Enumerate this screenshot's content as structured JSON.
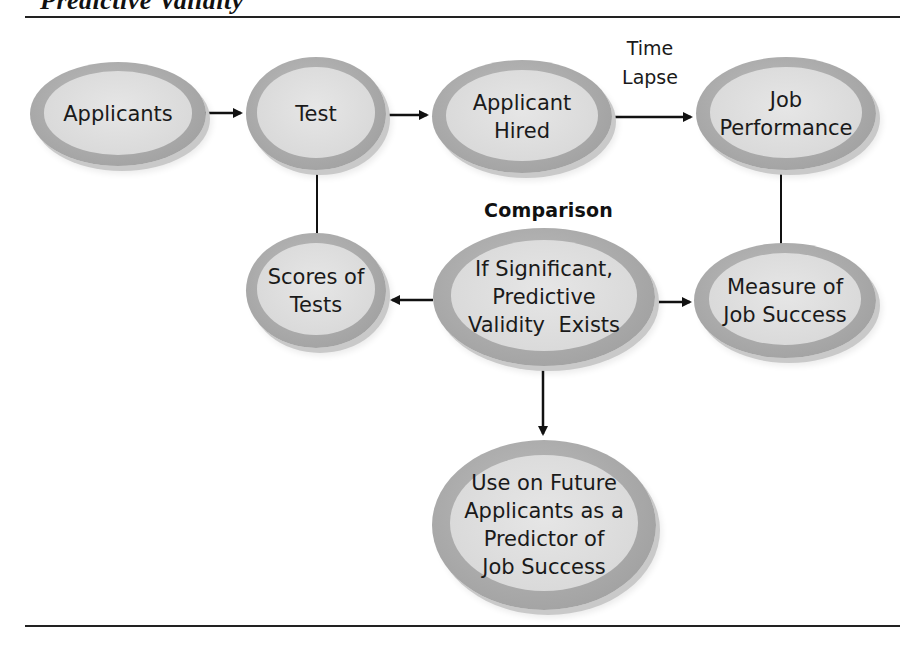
{
  "figure": {
    "title": "Predictive Validity"
  },
  "nodes": {
    "applicants": {
      "lines": [
        "Applicants"
      ]
    },
    "test": {
      "lines": [
        "Test"
      ]
    },
    "applicant_hired": {
      "lines": [
        "Applicant",
        "Hired"
      ]
    },
    "job_performance": {
      "lines": [
        "Job",
        "Performance"
      ]
    },
    "scores_of_tests": {
      "lines": [
        "Scores of",
        "Tests"
      ]
    },
    "comparison_result": {
      "lines": [
        "If Significant,",
        "Predictive",
        "Validity  Exists"
      ]
    },
    "measure_of_job_success": {
      "lines": [
        "Measure of",
        "Job Success"
      ]
    },
    "future_use": {
      "lines": [
        "Use on Future",
        "Applicants as a",
        "Predictor of",
        "Job Success"
      ]
    }
  },
  "labels": {
    "time_lapse": [
      "Time",
      "Lapse"
    ],
    "comparison": "Comparison"
  },
  "edges": [
    {
      "from": "Applicants",
      "to": "Test",
      "type": "arrow"
    },
    {
      "from": "Test",
      "to": "Applicant Hired",
      "type": "arrow"
    },
    {
      "from": "Applicant Hired",
      "to": "Job Performance",
      "type": "arrow",
      "label": "Time Lapse"
    },
    {
      "from": "Test",
      "to": "Scores of Tests",
      "type": "line"
    },
    {
      "from": "Job Performance",
      "to": "Measure of Job Success",
      "type": "line"
    },
    {
      "from": "If Significant, Predictive Validity Exists",
      "to": "Scores of Tests",
      "type": "arrow"
    },
    {
      "from": "If Significant, Predictive Validity Exists",
      "to": "Measure of Job Success",
      "type": "arrow"
    },
    {
      "from": "If Significant, Predictive Validity Exists",
      "to": "Use on Future Applicants as a Predictor of Job Success",
      "type": "arrow"
    }
  ],
  "colors": {
    "node_outer": "#a8a8a8",
    "node_inner": "#dcdcdc",
    "text": "#1a1a1a",
    "connector": "#111111"
  }
}
